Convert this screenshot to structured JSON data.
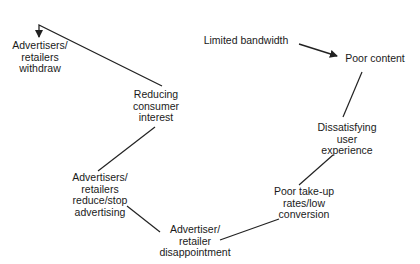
{
  "diagram": {
    "type": "vicious-cycle flow",
    "colors": {
      "text": "#1a1a1a",
      "line": "#222222",
      "background": "#ffffff"
    },
    "nodes": {
      "withdraw": {
        "lines": [
          "Advertisers/",
          "retailers",
          "withdraw"
        ]
      },
      "reducing_interest": {
        "lines": [
          "Reducing",
          "consumer",
          "interest"
        ]
      },
      "reduce_advertising": {
        "lines": [
          "Advertisers/",
          "retailers",
          "reduce/stop",
          "advertising"
        ]
      },
      "disappointment": {
        "lines": [
          "Advertiser/",
          "retailer",
          "disappointment"
        ]
      },
      "poor_takeup": {
        "lines": [
          "Poor take-up",
          "rates/low",
          "conversion"
        ]
      },
      "dissatisfying": {
        "lines": [
          "Dissatisfying",
          "user",
          "experience"
        ]
      },
      "poor_content": {
        "lines": [
          "Poor content"
        ]
      },
      "limited_bandwidth": {
        "lines": [
          "Limited bandwidth"
        ]
      }
    },
    "edges": [
      {
        "from": "limited_bandwidth",
        "to": "poor_content",
        "arrow": true
      },
      {
        "from": "poor_content",
        "to": "dissatisfying",
        "arrow": false
      },
      {
        "from": "dissatisfying",
        "to": "poor_takeup",
        "arrow": false
      },
      {
        "from": "poor_takeup",
        "to": "disappointment",
        "arrow": false
      },
      {
        "from": "disappointment",
        "to": "reduce_advertising",
        "arrow": false
      },
      {
        "from": "reduce_advertising",
        "to": "reducing_interest",
        "arrow": false
      },
      {
        "from": "reducing_interest",
        "to": "withdraw",
        "arrow": true
      }
    ]
  }
}
